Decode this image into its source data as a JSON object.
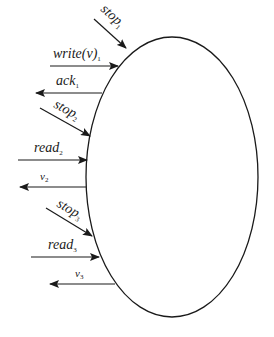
{
  "diagram": {
    "type": "process-interface",
    "shape": "ellipse",
    "colors": {
      "stroke": "#1a1a1a",
      "background": "#ffffff"
    },
    "ellipse": {
      "cx": 172,
      "cy": 177,
      "rx": 86,
      "ry": 140
    },
    "arrows": [
      {
        "id": "stop1",
        "label": "stop",
        "subscript": "1",
        "direction": "in"
      },
      {
        "id": "write1",
        "label": "write(v)",
        "subscript": "1",
        "direction": "in"
      },
      {
        "id": "ack1",
        "label": "ack",
        "subscript": "1",
        "direction": "out"
      },
      {
        "id": "stop2",
        "label": "stop",
        "subscript": "2",
        "direction": "in"
      },
      {
        "id": "read2",
        "label": "read",
        "subscript": "2",
        "direction": "in"
      },
      {
        "id": "v2",
        "label": "v",
        "subscript": "2",
        "direction": "out"
      },
      {
        "id": "stop3",
        "label": "stop",
        "subscript": "3",
        "direction": "in"
      },
      {
        "id": "read3",
        "label": "read",
        "subscript": "3",
        "direction": "in"
      },
      {
        "id": "v3",
        "label": "v",
        "subscript": "3",
        "direction": "out"
      }
    ]
  }
}
